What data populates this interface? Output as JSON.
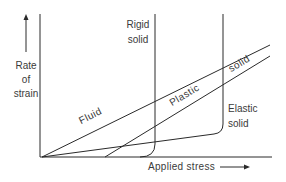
{
  "diagram": {
    "y_axis_label": [
      "Rate",
      "of",
      "strain"
    ],
    "x_axis_label": "Applied stress",
    "curves": {
      "fluid": "Fluid",
      "rigid_solid": [
        "Rigid",
        "solid"
      ],
      "plastic_solid": [
        "Plastic",
        "solid"
      ],
      "elastic_solid": [
        "Elastic",
        "solid"
      ]
    },
    "colors": {
      "line": "#2a2a2a",
      "text": "#3a3a3a",
      "background": "#ffffff"
    }
  }
}
